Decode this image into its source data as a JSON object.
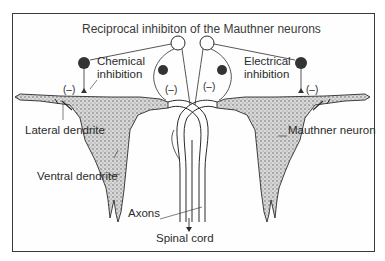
{
  "figure": {
    "title": "Reciprocal inhibiton of the Mauthner neurons",
    "labels": {
      "chemical_inhibition": [
        "Chemical",
        "inhibition"
      ],
      "electrical_inhibition": [
        "Electrical",
        "inhibition"
      ],
      "lateral_dendrite": "Lateral dendrite",
      "mauthner_neuron": "Mauthner neuron",
      "ventral_dendrite": "Ventral dendrite",
      "axons": "Axons",
      "spinal_cord": "Spinal cord"
    },
    "inhibition_marks": [
      "(–)",
      "(–)",
      "(–)",
      "(–)"
    ],
    "colors": {
      "ink": "#2b2b2b",
      "stipple": "#9a9a9a",
      "frame": "#3a3a3a"
    }
  }
}
